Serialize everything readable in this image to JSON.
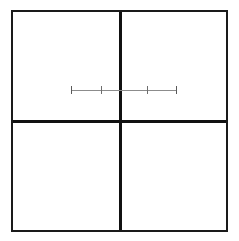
{
  "figure": {
    "title": "",
    "background_color": "#ffffff",
    "width": 239,
    "height": 241
  },
  "panel_grid": {
    "name": "2x2 panel grid",
    "rows": 2,
    "columns": 2,
    "frame_color": "#1a1a1a",
    "frame_width_px": 2,
    "divider_color": "#111111",
    "divider_width_px": 3,
    "bounds": {
      "left": 11,
      "top": 10,
      "width": 217,
      "height": 222
    },
    "divider_vertical_x": 120,
    "divider_horizontal_y": 121,
    "quadrants": [
      {
        "id": "top-left",
        "label": ""
      },
      {
        "id": "top-right",
        "label": ""
      },
      {
        "id": "bottom-left",
        "label": ""
      },
      {
        "id": "bottom-right",
        "label": ""
      }
    ]
  },
  "chart_data": {
    "type": "scatter",
    "title": "",
    "subtitle": "",
    "xlabel": "",
    "ylabel": "",
    "grid": true,
    "legend": null,
    "annotations": [],
    "series": [
      {
        "name": "interval-segment",
        "orientation": "horizontal",
        "y": 90,
        "line_color": "#8c8c8c",
        "tick_color": "#6e6e6e",
        "x_start": 71,
        "x_end": 176,
        "tick_half_height": 4,
        "points": [
          {
            "x": 71,
            "kind": "end-cap"
          },
          {
            "x": 101,
            "kind": "tick"
          },
          {
            "x": 147,
            "kind": "tick"
          },
          {
            "x": 176,
            "kind": "end-cap"
          }
        ]
      }
    ],
    "xlim": [
      71,
      176
    ],
    "ylim": [
      90,
      90
    ]
  },
  "accessibility": {
    "figure_description": "A square outline divided into four equal panels by one vertical and one horizontal rule. A thin horizontal line segment with four tick marks crosses the upper half, spanning from the left panel into the right panel."
  }
}
